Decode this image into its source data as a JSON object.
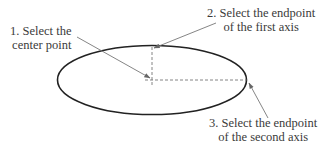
{
  "diagram": {
    "title": "",
    "shape": "ellipse",
    "ellipse": {
      "cx": 152,
      "cy": 80,
      "rx": 94.5,
      "ry": 34.5,
      "stroke": "#222222"
    },
    "guides": {
      "color": "#666666",
      "style": "dashed"
    },
    "arrow_color": "#777777",
    "steps": [
      {
        "id": 1,
        "lines": [
          "1. Select the",
          "center point"
        ]
      },
      {
        "id": 2,
        "lines": [
          "2. Select the endpoint",
          "of the first axis"
        ]
      },
      {
        "id": 3,
        "lines": [
          "3. Select the endpoint",
          "of the second axis"
        ]
      }
    ]
  }
}
